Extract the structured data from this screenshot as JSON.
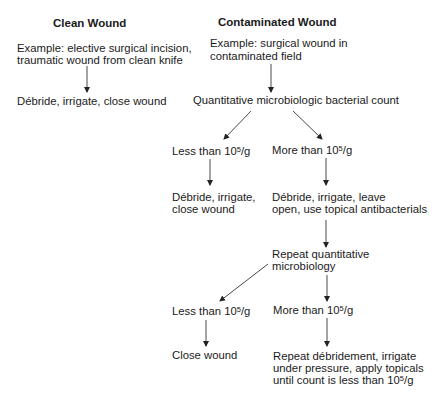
{
  "diagram": {
    "columns": {
      "clean": {
        "title": "Clean Wound",
        "example_line1": "Example: elective surgical incision,",
        "example_line2": "traumatic wound from clean knife",
        "action": "Débride, irrigate, close wound"
      },
      "contaminated": {
        "title": "Contaminated Wound",
        "example_line1": "Example: surgical wound in",
        "example_line2": "contaminated field",
        "test": "Quantitative microbiologic bacterial count",
        "branch1": {
          "less_prefix": "Less than 10",
          "more_prefix": "More than 10",
          "exp": "5",
          "unit": "/g",
          "less_action_line1": "Débride, irrigate,",
          "less_action_line2": "close wound",
          "more_action_line1": "Débride, irrigate, leave",
          "more_action_line2": "open, use topical antibacterials"
        },
        "repeat_test_line1": "Repeat quantitative",
        "repeat_test_line2": "microbiology",
        "branch2": {
          "less_prefix": "Less than 10",
          "more_prefix": "More than 10",
          "exp": "5",
          "unit": "/g",
          "less_action": "Close wound",
          "more_action_line1": "Repeat débridement, irrigate",
          "more_action_line2": "under pressure, apply topicals",
          "more_action_line3_prefix": "until count is less than 10",
          "more_action_line3_exp": "5",
          "more_action_line3_unit": "/g"
        }
      }
    },
    "colors": {
      "text": "#1a1a1a",
      "lines": "#333333",
      "background": "#ffffff"
    }
  }
}
